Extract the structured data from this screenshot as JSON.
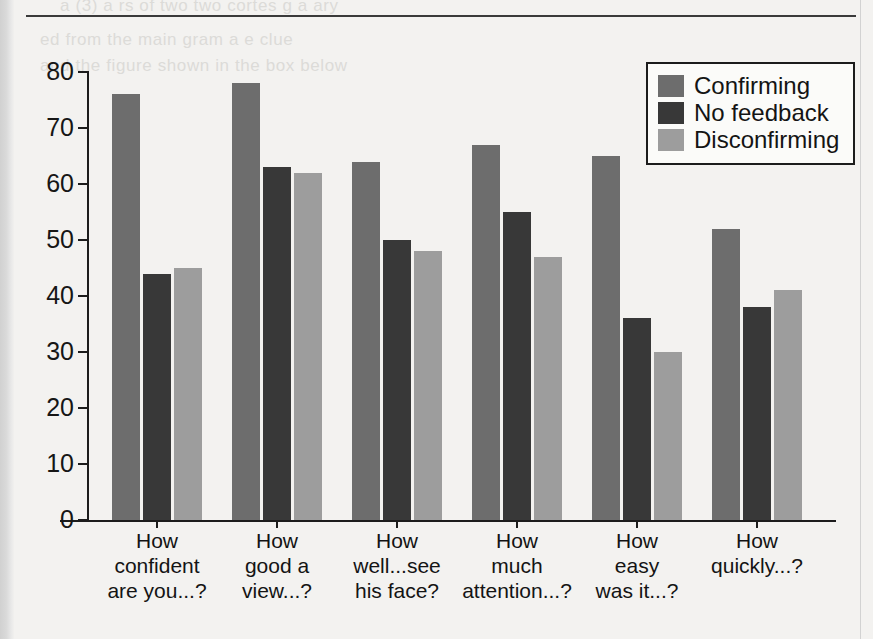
{
  "page": {
    "artifacts": {
      "bleed_lines": [
        "a  (3) a  rs  of  two  two  cortes  g  a  ary",
        "ed  from  the  main  gram  a  e  clue",
        "and  the  figure  shown  in  the  box  below"
      ]
    }
  },
  "chart_data": {
    "type": "bar",
    "title": "",
    "xlabel": "",
    "ylabel": "",
    "ylim": [
      0,
      80
    ],
    "yticks": [
      0,
      10,
      20,
      30,
      40,
      50,
      60,
      70,
      80
    ],
    "grid": false,
    "legend_position": "top-right",
    "categories": [
      "How\nconfident\nare you...?",
      "How\ngood a\nview...?",
      "How\nwell...see\nhis face?",
      "How\nmuch\nattention...?",
      "How\neasy\nwas it...?",
      "How\nquickly...?"
    ],
    "series": [
      {
        "name": "Confirming",
        "color": "#6d6d6d",
        "values": [
          76,
          78,
          64,
          67,
          65,
          52
        ]
      },
      {
        "name": "No feedback",
        "color": "#383838",
        "values": [
          44,
          63,
          50,
          55,
          36,
          38
        ]
      },
      {
        "name": "Disconfirming",
        "color": "#9d9d9d",
        "values": [
          45,
          62,
          48,
          47,
          30,
          41
        ]
      }
    ]
  }
}
